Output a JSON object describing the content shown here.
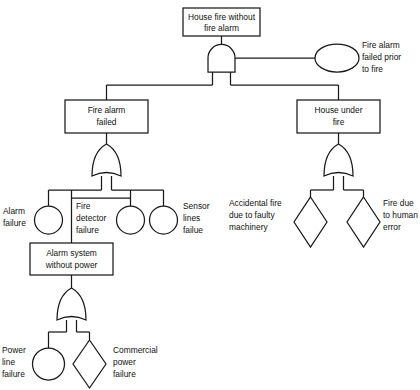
{
  "diagram": {
    "type": "fault-tree",
    "nodes": {
      "top_event": {
        "label_line1": "House fire without",
        "label_line2": "fire alarm"
      },
      "fire_alarm_failed_prior": {
        "label_line1": "Fire alarm",
        "label_line2": "failed prior",
        "label_line3": "to fire"
      },
      "fire_alarm_failed": {
        "label_line1": "Fire alarm",
        "label_line2": "failed"
      },
      "house_under_fire": {
        "label_line1": "House under",
        "label_line2": "fire"
      },
      "alarm_failure": {
        "label_line1": "Alarm",
        "label_line2": "failure"
      },
      "fire_detector_failure": {
        "label_line1": "Fire",
        "label_line2": "detector",
        "label_line3": "failure"
      },
      "sensor_lines_failue": {
        "label_line1": "Sensor",
        "label_line2": "lines",
        "label_line3": "failue"
      },
      "alarm_system_without_power": {
        "label_line1": "Alarm system",
        "label_line2": "without power"
      },
      "power_line_failure": {
        "label_line1": "Power",
        "label_line2": "line",
        "label_line3": "failure"
      },
      "commercial_power_failure": {
        "label_line1": "Commercial",
        "label_line2": "power",
        "label_line3": "failure"
      },
      "accidental_fire": {
        "label_line1": "Accidental fire",
        "label_line2": "due to faulty",
        "label_line3": "machinery"
      },
      "fire_due_to_human_error": {
        "label_line1": "Fire due",
        "label_line2": "to human",
        "label_line3": "error"
      }
    },
    "gates": {
      "top_and_gate": {
        "kind": "AND"
      },
      "fire_alarm_or_gate": {
        "kind": "OR"
      },
      "house_fire_or_gate": {
        "kind": "OR"
      },
      "alarm_power_or_gate": {
        "kind": "OR"
      }
    },
    "colors": {
      "stroke": "#1a1a1a",
      "fill": "#ffffff",
      "text": "#111111",
      "background": "#ffffff"
    }
  }
}
